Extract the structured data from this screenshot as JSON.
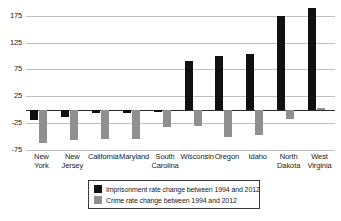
{
  "chart_data": {
    "type": "bar",
    "title": "",
    "subtitle": "",
    "xlabel": "",
    "ylabel": "",
    "ylim": [
      -75,
      195
    ],
    "yticks": [
      175,
      125,
      75,
      25,
      -25,
      -75
    ],
    "ytick_labels": [
      "175",
      "125",
      "75",
      "25",
      "-25",
      "-75"
    ],
    "grid": true,
    "legend_position": "bottom-center",
    "categories": [
      "New York",
      "New Jersey",
      "California",
      "Maryland",
      "South Carolina",
      "Wisconsin",
      "Oregon",
      "Idaho",
      "North Dakota",
      "West Virginia"
    ],
    "category_lines": [
      [
        "New",
        "York"
      ],
      [
        "New",
        "Jersey"
      ],
      [
        "California",
        ""
      ],
      [
        "Maryland",
        ""
      ],
      [
        "South",
        "Carolina"
      ],
      [
        "Wisconsin",
        ""
      ],
      [
        "Oregon",
        ""
      ],
      [
        "Idaho",
        ""
      ],
      [
        "North",
        "Dakota"
      ],
      [
        "West",
        "Virginia"
      ]
    ],
    "series": [
      {
        "name": "Imprisonment rate change between 1994 and 2012",
        "color": "#111111",
        "values": [
          -20,
          -13,
          -7,
          -6,
          -5,
          90,
          100,
          103,
          175,
          190
        ]
      },
      {
        "name": "Crime rate change between 1994 and 2012",
        "color": "#8f8f8f",
        "values": [
          -62,
          -57,
          -54,
          -54,
          -33,
          -31,
          -50,
          -48,
          -17,
          4
        ]
      }
    ]
  },
  "legend": {
    "items": [
      {
        "label": "Imprisonment rate change between 1994 and 2012",
        "color": "#111111"
      },
      {
        "label": "Crime rate change between 1994 and 2012",
        "color": "#8f8f8f"
      }
    ]
  },
  "colors": {
    "imprisonment": "#111111",
    "crime": "#8f8f8f",
    "gridline": "#bfbfbf",
    "axis": "#2b2b2b",
    "background": "#ffffff"
  }
}
